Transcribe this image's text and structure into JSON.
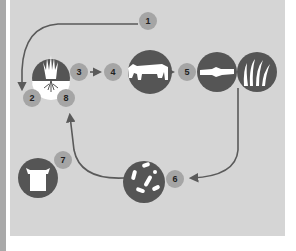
{
  "diagram": {
    "type": "cycle",
    "colors": {
      "panel_background": "#d5d5d5",
      "left_strip": "#a9a9a9",
      "icon_circle": "#555555",
      "badge": "#a5a5a5",
      "arrow": "#5a5a5a",
      "icon_glyph": "#ffffff"
    },
    "badges": [
      {
        "id": "1",
        "label": "1"
      },
      {
        "id": "2",
        "label": "2"
      },
      {
        "id": "3",
        "label": "3"
      },
      {
        "id": "4",
        "label": "4"
      },
      {
        "id": "5",
        "label": "5"
      },
      {
        "id": "6",
        "label": "6"
      },
      {
        "id": "7",
        "label": "7"
      },
      {
        "id": "8",
        "label": "8"
      }
    ],
    "nodes": [
      {
        "id": "plant-roots",
        "icon": "plant-with-roots-icon"
      },
      {
        "id": "cow",
        "icon": "cow-icon"
      },
      {
        "id": "log",
        "icon": "log-icon"
      },
      {
        "id": "grass",
        "icon": "grass-icon"
      },
      {
        "id": "microbes",
        "icon": "microbes-icon"
      },
      {
        "id": "bag",
        "icon": "bag-icon"
      }
    ],
    "edges": [
      {
        "from": "1",
        "to": "2",
        "style": "curved-arrow"
      },
      {
        "from": "3",
        "to": "4",
        "style": "short-arrow"
      },
      {
        "from": "cow",
        "to": "5",
        "style": "short-arrow"
      },
      {
        "from": "grass",
        "to": "6",
        "style": "curved-arrow"
      },
      {
        "from": "microbes",
        "to": "8",
        "style": "curved-arrow"
      }
    ]
  }
}
